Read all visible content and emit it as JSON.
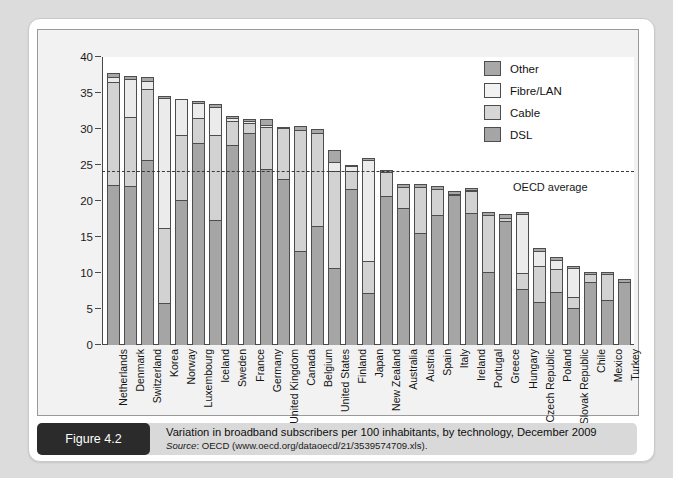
{
  "figure": {
    "badge_label": "Figure 4.2",
    "title": "Variation in broadband subscribers per 100 inhabitants, by technology, December 2009",
    "source_prefix": "Source",
    "source_text": ": OECD (www.oecd.org/dataoecd/21/3539574709.xls)."
  },
  "legend": {
    "position": "top-right",
    "items": [
      {
        "label": "Other",
        "color": "#a8a8a8",
        "key": "other"
      },
      {
        "label": "Fibre/LAN",
        "color": "#f2f2f2",
        "key": "fibre"
      },
      {
        "label": "Cable",
        "color": "#d6d6d6",
        "key": "cable"
      },
      {
        "label": "DSL",
        "color": "#a5a5a5",
        "key": "dsl"
      }
    ]
  },
  "annotations": {
    "oecd_average_label": "OECD average",
    "oecd_average_value": 24.2
  },
  "chart_data": {
    "type": "bar",
    "stacked": true,
    "title": "Variation in broadband subscribers per 100 inhabitants, by technology, December 2009",
    "xlabel": "",
    "ylabel": "",
    "ylim": [
      0,
      40
    ],
    "yticks": [
      0,
      5,
      10,
      15,
      20,
      25,
      30,
      35,
      40
    ],
    "ytick_labels": [
      "0",
      "5",
      "10",
      "15",
      "20",
      "25",
      "30",
      "35",
      "40"
    ],
    "grid": false,
    "legend_position": "top-right",
    "series_order": [
      "DSL",
      "Cable",
      "Fibre/LAN",
      "Other"
    ],
    "categories": [
      "Netherlands",
      "Denmark",
      "Switzerland",
      "Korea",
      "Norway",
      "Luxembourg",
      "Iceland",
      "Sweden",
      "France",
      "Germany",
      "United Kingdom",
      "Canada",
      "Belgium",
      "United States",
      "Finland",
      "Japan",
      "New Zealand",
      "Australia",
      "Austria",
      "Spain",
      "Italy",
      "Ireland",
      "Portugal",
      "Greece",
      "Hungary",
      "Czech Republic",
      "Poland",
      "Slovak Republic",
      "Chile",
      "Mexico",
      "Turkey"
    ],
    "series": [
      {
        "name": "DSL",
        "values": [
          22.2,
          22.1,
          25.7,
          5.8,
          20.2,
          28.0,
          17.4,
          27.8,
          29.5,
          24.5,
          23.1,
          13.0,
          16.5,
          10.7,
          21.7,
          7.2,
          20.7,
          19.0,
          15.6,
          18.0,
          20.9,
          18.4,
          10.2,
          17.2,
          7.8,
          6.0,
          7.4,
          5.2,
          8.7,
          6.3,
          8.8
        ]
      },
      {
        "name": "Cable",
        "values": [
          14.3,
          9.5,
          9.8,
          10.5,
          8.9,
          3.5,
          11.8,
          3.3,
          1.4,
          5.8,
          7.0,
          16.8,
          13.0,
          13.4,
          2.4,
          4.4,
          3.3,
          3.0,
          6.4,
          3.7,
          0.0,
          3.0,
          7.9,
          0.4,
          2.2,
          5.0,
          3.2,
          1.5,
          1.1,
          3.6,
          0.0
        ]
      },
      {
        "name": "Fibre/LAN",
        "values": [
          0.7,
          5.4,
          1.2,
          18.0,
          4.9,
          2.1,
          3.9,
          0.4,
          0.2,
          0.2,
          0.0,
          0.0,
          0.0,
          1.3,
          0.7,
          14.1,
          0.0,
          0.0,
          0.0,
          0.0,
          0.1,
          0.1,
          0.0,
          0.0,
          8.2,
          2.0,
          1.2,
          4.0,
          0.0,
          0.0,
          0.0
        ]
      },
      {
        "name": "Other",
        "values": [
          0.5,
          0.2,
          0.4,
          0.2,
          0.0,
          0.2,
          0.2,
          0.1,
          0.2,
          0.8,
          0.1,
          0.5,
          0.4,
          1.5,
          0.1,
          0.2,
          0.2,
          0.2,
          0.2,
          0.2,
          0.2,
          0.1,
          0.2,
          0.4,
          0.2,
          0.4,
          0.3,
          0.2,
          0.2,
          0.1,
          0.2
        ]
      }
    ],
    "totals": [
      37.7,
      37.2,
      37.1,
      34.5,
      34.0,
      33.8,
      33.3,
      31.6,
      31.3,
      31.3,
      30.2,
      30.3,
      29.9,
      26.9,
      24.9,
      25.9,
      24.2,
      22.2,
      22.2,
      21.9,
      21.2,
      21.6,
      18.3,
      18.0,
      18.4,
      13.4,
      12.1,
      10.9,
      10.0,
      10.0,
      9.0
    ]
  }
}
